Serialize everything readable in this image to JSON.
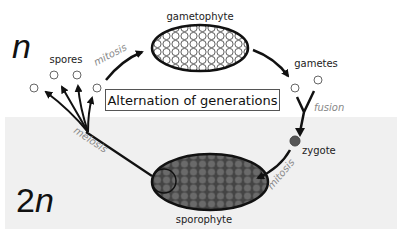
{
  "diagram": {
    "title": "Alternation of generations",
    "haploid_label": {
      "prefix": "",
      "symbol": "n"
    },
    "diploid_label": {
      "prefix": "2",
      "symbol": "n"
    },
    "stages": {
      "gametophyte": "gametophyte",
      "gametes": "gametes",
      "zygote": "zygote",
      "sporophyte": "sporophyte",
      "spores": "spores"
    },
    "processes": {
      "mitosis_haploid": "mitosis",
      "fusion": "fusion",
      "mitosis_diploid": "mitosis",
      "meiosis": "meiosis"
    },
    "colors": {
      "haploid_bg": "#ffffff",
      "diploid_bg": "#f0f0f0",
      "gametophyte_fill": "#ffffff",
      "sporophyte_fill": "#555555",
      "zygote_fill": "#555555",
      "arrow": "#111111",
      "process_text": "#888888"
    }
  }
}
